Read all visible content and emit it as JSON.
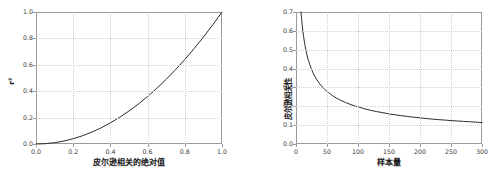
{
  "figure": {
    "background": "#ffffff",
    "axis_color": "#9a9a9a",
    "grid_color": "#d2d2d2",
    "curve_color": "#2b2b2b"
  },
  "chart_data": [
    {
      "id": "left",
      "type": "line",
      "title": "",
      "xlabel": "皮尔逊相关的绝对值",
      "ylabel": "r²",
      "xlim": [
        0.0,
        1.0
      ],
      "ylim": [
        0.0,
        1.0
      ],
      "grid": true,
      "legend": "none",
      "xticks": [
        "0.0",
        "0.2",
        "0.4",
        "0.6",
        "0.8",
        "1.0"
      ],
      "xtick_values": [
        0.0,
        0.2,
        0.4,
        0.6,
        0.8,
        1.0
      ],
      "yticks": [
        "0.0",
        "0.2",
        "0.4",
        "0.6",
        "0.8",
        "1.0"
      ],
      "ytick_values": [
        0.0,
        0.2,
        0.4,
        0.6,
        0.8,
        1.0
      ],
      "series": [
        {
          "name": "r squared",
          "x": [
            0.0,
            0.05,
            0.1,
            0.15,
            0.2,
            0.25,
            0.3,
            0.35,
            0.4,
            0.45,
            0.5,
            0.55,
            0.6,
            0.65,
            0.7,
            0.75,
            0.8,
            0.85,
            0.9,
            0.95,
            1.0
          ],
          "values": [
            0.0,
            0.0025,
            0.01,
            0.0225,
            0.04,
            0.0625,
            0.09,
            0.1225,
            0.16,
            0.2025,
            0.25,
            0.3025,
            0.36,
            0.4225,
            0.49,
            0.5625,
            0.64,
            0.7225,
            0.81,
            0.9025,
            1.0
          ]
        }
      ]
    },
    {
      "id": "right",
      "type": "line",
      "title": "",
      "xlabel": "样本量",
      "ylabel": "皮尔逊相关性",
      "xlim": [
        0,
        300
      ],
      "ylim": [
        0.0,
        0.7
      ],
      "grid": true,
      "legend": "none",
      "xticks": [
        "0",
        "50",
        "100",
        "150",
        "200",
        "250",
        "300"
      ],
      "xtick_values": [
        0,
        50,
        100,
        150,
        200,
        250,
        300
      ],
      "yticks": [
        "0.0",
        "0.1",
        "0.2",
        "0.3",
        "0.4",
        "0.5",
        "0.6",
        "0.7"
      ],
      "ytick_values": [
        0.0,
        0.1,
        0.2,
        0.3,
        0.4,
        0.5,
        0.6,
        0.7
      ],
      "series": [
        {
          "name": "critical correlation",
          "x": [
            8,
            10,
            12,
            15,
            18,
            20,
            25,
            30,
            35,
            40,
            45,
            50,
            60,
            70,
            80,
            90,
            100,
            110,
            120,
            130,
            140,
            150,
            160,
            170,
            180,
            190,
            200,
            210,
            220,
            230,
            240,
            250,
            260,
            270,
            280,
            290,
            300
          ],
          "values": [
            0.7,
            0.632,
            0.576,
            0.514,
            0.468,
            0.444,
            0.396,
            0.361,
            0.334,
            0.312,
            0.294,
            0.279,
            0.254,
            0.235,
            0.22,
            0.207,
            0.197,
            0.187,
            0.179,
            0.172,
            0.166,
            0.16,
            0.155,
            0.15,
            0.146,
            0.142,
            0.139,
            0.135,
            0.132,
            0.129,
            0.127,
            0.124,
            0.122,
            0.12,
            0.118,
            0.116,
            0.113
          ]
        }
      ]
    }
  ]
}
